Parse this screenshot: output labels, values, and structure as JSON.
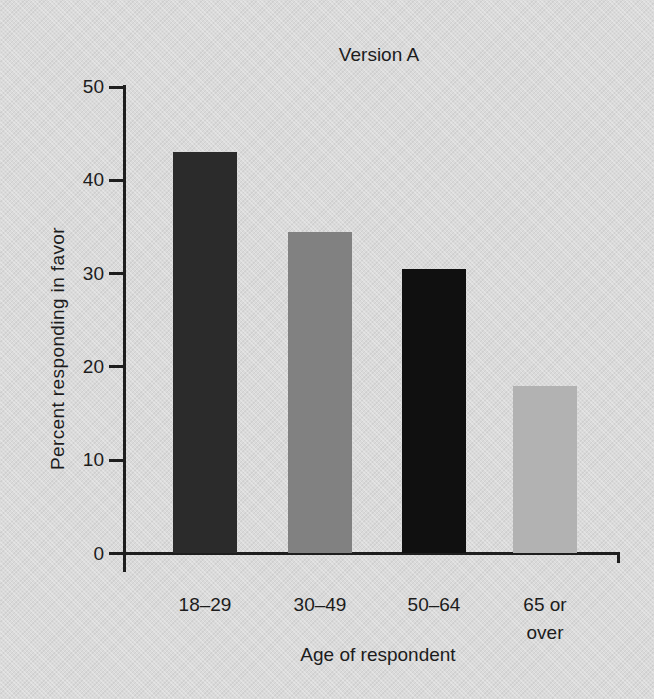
{
  "chart_data": {
    "type": "bar",
    "title": "Version A",
    "xlabel": "Age of respondent",
    "ylabel": "Percent responding in favor",
    "categories": [
      "18–29",
      "30–49",
      "50–64",
      "65 or over"
    ],
    "values": [
      43,
      34.5,
      30.5,
      18
    ],
    "bar_colors": [
      "#2b2b2b",
      "#818181",
      "#101010",
      "#b2b2b2"
    ],
    "yticks": [
      0,
      10,
      20,
      30,
      40,
      50
    ],
    "ylim": [
      0,
      50
    ],
    "xlim_note": "categorical axis",
    "grid": false,
    "legend": null
  },
  "colors": {
    "background": "#dadada",
    "axis": "#1e1e1e",
    "text": "#1c1c1c"
  }
}
